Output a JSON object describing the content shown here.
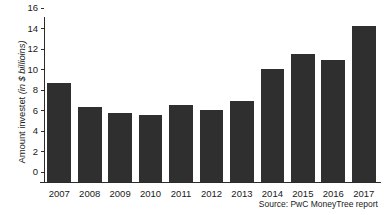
{
  "chart_data": {
    "type": "bar",
    "title": "",
    "xlabel": "",
    "ylabel": "Amount investet (in $ billioins)",
    "ylabel_prefix": "Amount investet ",
    "ylabel_unit": "(in $ billioins)",
    "categories": [
      "2007",
      "2008",
      "2009",
      "2010",
      "2011",
      "2012",
      "2013",
      "2014",
      "2015",
      "2016",
      "2017"
    ],
    "values": [
      9.7,
      7.3,
      6.7,
      6.5,
      7.5,
      7.0,
      7.9,
      11.0,
      12.5,
      11.9,
      15.2
    ],
    "ylim": [
      0,
      16
    ],
    "yticks": [
      0,
      2,
      4,
      6,
      8,
      10,
      12,
      14,
      16
    ],
    "ytick_labels": [
      "0",
      "2",
      "4",
      "6",
      "8",
      "10",
      "12",
      "14",
      "16"
    ],
    "grid": false,
    "legend": null,
    "bar_color": "#2f2f2f",
    "axis_color": "#2b2b2b",
    "background": "#ffffff"
  },
  "source": {
    "text": "Source: PwC MoneyTree report"
  }
}
